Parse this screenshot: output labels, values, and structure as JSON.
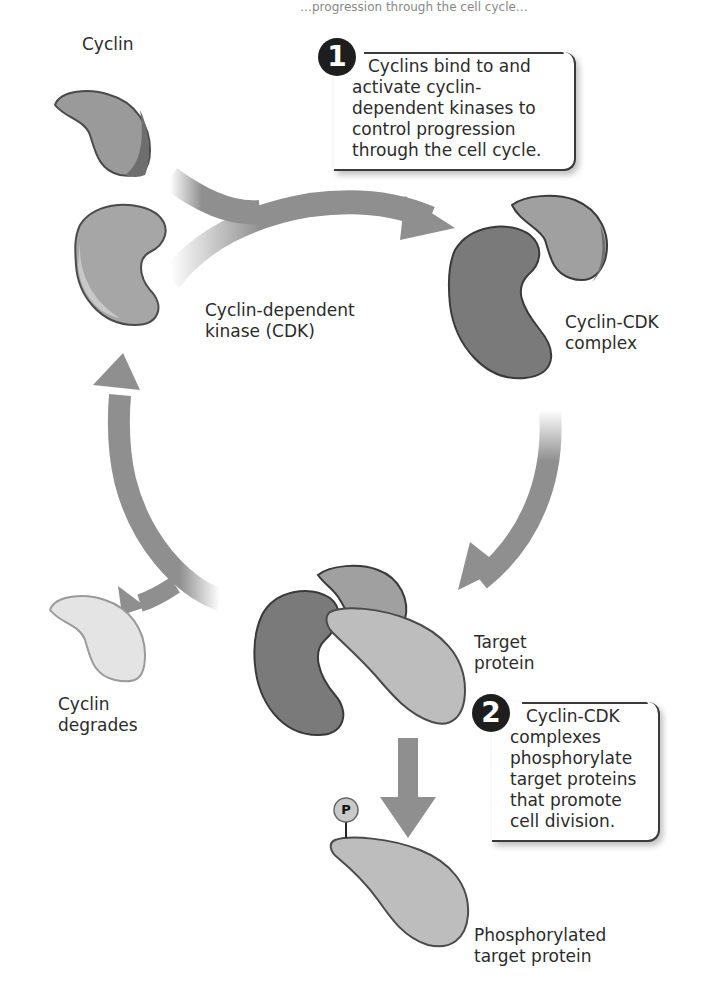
{
  "diagram": {
    "type": "cell-cycle-regulation",
    "header_fragment": "…progression through the cell cycle…",
    "labels": {
      "cyclin": "Cyclin",
      "cdk_line1": "Cyclin-dependent",
      "cdk_line2": "kinase (CDK)",
      "complex_line1": "Cyclin-CDK",
      "complex_line2": "complex",
      "target_line1": "Target",
      "target_line2": "protein",
      "degrades_line1": "Cyclin",
      "degrades_line2": "degrades",
      "phospho_line1": "Phosphorylated",
      "phospho_line2": "target protein",
      "phosphate": "P"
    },
    "steps": [
      {
        "number": "1",
        "lines": [
          "Cyclins bind to and",
          "activate cyclin-",
          "dependent kinases to",
          "control progression",
          "through the cell cycle."
        ]
      },
      {
        "number": "2",
        "lines": [
          "Cyclin-CDK",
          "complexes",
          "phosphorylate",
          "target proteins",
          "that promote",
          "cell division."
        ]
      }
    ],
    "colors": {
      "arrow": "#8f8f8f",
      "cyclin_fill": "#9a9a9a",
      "cdk_fill": "#a6a6a6",
      "complex_cdk_fill": "#7a7a7a",
      "target_fill": "#bdbdbd",
      "degraded_fill": "#e4e4e4",
      "outline": "#4a4a4a"
    }
  }
}
